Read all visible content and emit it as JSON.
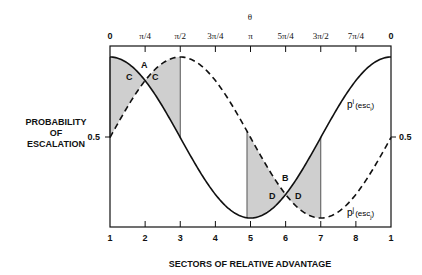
{
  "chart_data": {
    "type": "line",
    "title": "",
    "top_axis_label": "θ",
    "top_ticks": [
      "0",
      "π/4",
      "π/2",
      "3π/4",
      "π",
      "5π/4",
      "3π/2",
      "7π/4",
      "0"
    ],
    "xlabel": "SECTORS OF RELATIVE ADVANTAGE",
    "x_ticks": [
      "1",
      "2",
      "3",
      "4",
      "5",
      "6",
      "7",
      "8",
      "1"
    ],
    "ylabel": "PROBABILITY OF ESCALATION",
    "y_ticks": [
      "0.5"
    ],
    "series": [
      {
        "name": "p^i(esc_i)",
        "style": "solid",
        "formula": "0.5 + 0.45*cos(theta)",
        "x": [
          1,
          2,
          3,
          4,
          5,
          6,
          7,
          8,
          1
        ],
        "values": [
          0.95,
          0.82,
          0.5,
          0.18,
          0.05,
          0.18,
          0.5,
          0.82,
          0.95
        ]
      },
      {
        "name": "p^j(esc_j)",
        "style": "dashed",
        "formula": "0.5 + 0.45*sin(theta)",
        "x": [
          1,
          2,
          3,
          4,
          5,
          6,
          7,
          8,
          1
        ],
        "values": [
          0.5,
          0.82,
          0.95,
          0.82,
          0.5,
          0.18,
          0.05,
          0.18,
          0.5
        ]
      }
    ],
    "shaded_regions": [
      {
        "from_sector": 1,
        "to_sector": 3,
        "labels": [
          "C",
          "C"
        ]
      },
      {
        "from_sector": 4.9,
        "to_sector": 7,
        "labels": [
          "D",
          "D"
        ]
      }
    ],
    "annotations": [
      "A",
      "B",
      "C",
      "C",
      "D",
      "D"
    ],
    "grid": false
  },
  "labels": {
    "theta": "θ",
    "xlabel": "SECTORS OF RELATIVE ADVANTAGE",
    "ylabel_1": "PROBABILITY",
    "ylabel_2": "OF",
    "ylabel_3": "ESCALATION",
    "y_left": "0.5",
    "y_right": "0.5",
    "A": "A",
    "B": "B",
    "C": "C",
    "D": "D",
    "pi_base": "p",
    "pi_sup": "i",
    "pi_arg": "(esc",
    "pi_sub": "i",
    "pi_close": ")",
    "pj_base": "p",
    "pj_sup": "j",
    "pj_arg": "(esc",
    "pj_sub": "j",
    "pj_close": ")"
  }
}
